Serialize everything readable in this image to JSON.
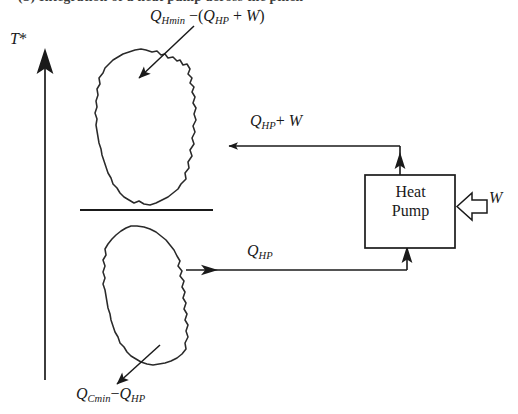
{
  "figure": {
    "domain": "diagram",
    "type": "pinch-analysis-heat-pump-placement",
    "background_color": "#ffffff",
    "line_color": "#1a1a1a",
    "caption_clipped": "(b) Integration of a heat pump across the pinch"
  },
  "axis": {
    "label": "T*",
    "label_text": "T",
    "label_star": "*",
    "direction": "up",
    "arrow_name": "temperature-axis-arrow"
  },
  "curves": {
    "hot_composite": {
      "name": "hot-composite-curve",
      "position": "above-pinch"
    },
    "cold_composite": {
      "name": "cold-composite-curve",
      "position": "below-pinch"
    },
    "pinch_line": {
      "name": "pinch-line",
      "label": ""
    }
  },
  "labels": {
    "top_heat": {
      "base": "Q",
      "sub": "Hmin",
      "minus": "−",
      "open": "(",
      "base2": "Q",
      "sub2": "HP",
      "plus": "+",
      "work": "W",
      "close": ")",
      "plain": "Q_Hmin - (Q_HP + W)"
    },
    "upper_stream": {
      "base": "Q",
      "sub": "HP",
      "plus": "+",
      "work": "W",
      "plain": "Q_HP + W"
    },
    "lower_stream": {
      "base": "Q",
      "sub": "HP",
      "plain": "Q_HP"
    },
    "bottom_heat": {
      "base": "Q",
      "sub": "Cmin",
      "minus": "−",
      "base2": "Q",
      "sub2": "HP",
      "plain": "Q_Cmin - Q_HP"
    },
    "work_input": {
      "text": "W",
      "plain": "W"
    }
  },
  "heat_pump": {
    "name": "heat-pump-box",
    "line1": "Heat",
    "line2": "Pump",
    "plain": "Heat Pump"
  },
  "arrows": {
    "top_label_pointer": "arrow-to-hot-curve",
    "bottom_label_pointer": "arrow-to-cold-curve",
    "upper_stream_arrow": "heat-delivered-arrow-left",
    "lower_stream_arrow": "heat-absorbed-arrow-right",
    "work_arrow": "work-input-block-arrow",
    "hp_outlet_arrow": "heat-pump-outlet-arrow-up",
    "hp_inlet_arrow": "heat-pump-inlet-arrow-up"
  }
}
